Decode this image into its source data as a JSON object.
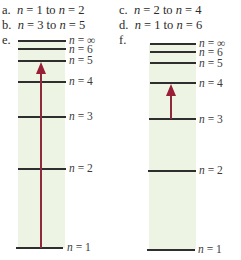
{
  "choices": [
    {
      "letter": "a.",
      "from": "1",
      "to": "2"
    },
    {
      "letter": "b.",
      "from": "3",
      "to": "5"
    },
    {
      "letter": "c.",
      "from": "2",
      "to": "4"
    },
    {
      "letter": "d.",
      "from": "1",
      "to": "6"
    }
  ],
  "n_symbol": "n",
  "equals": " = ",
  "to_word": " to ",
  "diagrams": [
    {
      "letter": "e.",
      "levels": [
        "∞",
        "6",
        "5",
        "4",
        "3",
        "2",
        "1"
      ],
      "arrow": {
        "from": "1",
        "to": "5"
      }
    },
    {
      "letter": "f.",
      "levels": [
        "∞",
        "6",
        "5",
        "4",
        "3",
        "2",
        "1"
      ],
      "arrow": {
        "from": "3",
        "to": "4"
      }
    }
  ],
  "colors": {
    "band": "#eef4e3",
    "arrow": "#9a1e36",
    "line": "#2e2e2e"
  }
}
